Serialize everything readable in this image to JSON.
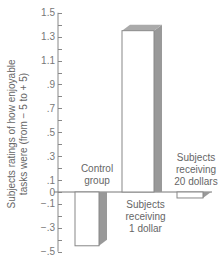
{
  "chart_data": {
    "type": "bar",
    "title": "",
    "xlabel": "",
    "ylabel": "Subjects ratings of how enjoyable tasks were (from − 5 to + 5)",
    "ylim": [
      -0.5,
      1.5
    ],
    "y_ticks_labeled": [
      "1.5",
      "1.3",
      "1.1",
      ".9",
      ".7",
      ".5",
      ".3",
      ".1",
      "0",
      "−.1",
      "−.3",
      "−.5"
    ],
    "y_ticks_values": [
      1.5,
      1.3,
      1.1,
      0.9,
      0.7,
      0.5,
      0.3,
      0.1,
      0,
      -0.1,
      -0.3,
      -0.5
    ],
    "grid": false,
    "legend": null,
    "categories": [
      "Control group",
      "Subjects receiving 1 dollar",
      "Subjects receiving 20 dollars"
    ],
    "values": [
      -0.45,
      1.35,
      -0.05
    ],
    "bar_style": "3d-shaded",
    "colors": {
      "bar_face": "#ffffff",
      "bar_edge": "#888888",
      "bar_shade": "#999999",
      "axis": "#888888"
    }
  },
  "labels": {
    "ylabel_line1": "Subjects ratings of how enjoyable",
    "ylabel_line2": "tasks were (from − 5 to + 5)",
    "cat1_line1": "Control",
    "cat1_line2": "group",
    "cat2_line1": "Subjects",
    "cat2_line2": "receiving",
    "cat2_line3": "1 dollar",
    "cat3_line1": "Subjects",
    "cat3_line2": "receiving",
    "cat3_line3": "20 dollars"
  }
}
